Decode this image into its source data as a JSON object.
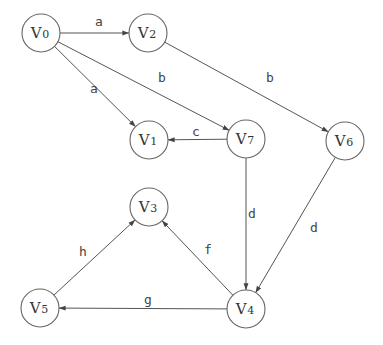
{
  "diagram": {
    "type": "directed-graph",
    "node_radius": 19,
    "colors": {
      "stroke": "#666666",
      "edge": "#555555",
      "text": "#333333",
      "background": "#ffffff"
    },
    "nodes": [
      {
        "id": "V0",
        "letter": "V",
        "sub": "0",
        "x": 41,
        "y": 33
      },
      {
        "id": "V1",
        "letter": "V",
        "sub": "1",
        "x": 149,
        "y": 140
      },
      {
        "id": "V2",
        "letter": "V",
        "sub": "2",
        "x": 148,
        "y": 33
      },
      {
        "id": "V3",
        "letter": "V",
        "sub": "3",
        "x": 149,
        "y": 207
      },
      {
        "id": "V4",
        "letter": "V",
        "sub": "4",
        "x": 246,
        "y": 309
      },
      {
        "id": "V5",
        "letter": "V",
        "sub": "5",
        "x": 40,
        "y": 308
      },
      {
        "id": "V6",
        "letter": "V",
        "sub": "6",
        "x": 345,
        "y": 141
      },
      {
        "id": "V7",
        "letter": "V",
        "sub": "7",
        "x": 246,
        "y": 139
      }
    ],
    "edges": [
      {
        "from": "V0",
        "to": "V2",
        "label": "a",
        "lx": 99,
        "ly": 26
      },
      {
        "from": "V0",
        "to": "V1",
        "label": "a",
        "lx": 94,
        "ly": 93
      },
      {
        "from": "V0",
        "to": "V7",
        "label": "b",
        "lx": 162,
        "ly": 82
      },
      {
        "from": "V2",
        "to": "V6",
        "label": "b",
        "lx": 270,
        "ly": 82
      },
      {
        "from": "V7",
        "to": "V1",
        "label": "c",
        "lx": 196,
        "ly": 136
      },
      {
        "from": "V7",
        "to": "V4",
        "label": "d",
        "lx": 252,
        "ly": 218
      },
      {
        "from": "V6",
        "to": "V4",
        "label": "d",
        "lx": 314,
        "ly": 232
      },
      {
        "from": "V4",
        "to": "V3",
        "label": "f",
        "lx": 208,
        "ly": 254
      },
      {
        "from": "V4",
        "to": "V5",
        "label": "g",
        "lx": 148,
        "ly": 304
      },
      {
        "from": "V5",
        "to": "V3",
        "label": "h",
        "lx": 83,
        "ly": 256
      }
    ]
  }
}
